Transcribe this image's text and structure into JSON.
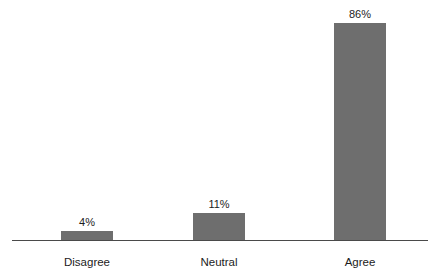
{
  "chart_data": {
    "type": "bar",
    "title": "",
    "subtitle": "",
    "xlabel": "",
    "ylabel": "",
    "categories": [
      "Disagree",
      "Neutral",
      "Agree"
    ],
    "values": [
      4,
      11,
      86
    ],
    "value_labels": [
      "4%",
      "11%",
      "86%"
    ],
    "ylim": [
      0,
      100
    ],
    "grid": false,
    "legend": false,
    "legend_position": "none",
    "axis_visible": {
      "x": true,
      "y": false
    },
    "orientation": "vertical",
    "units": "percent",
    "series": [
      {
        "name": "Response share",
        "values": [
          4,
          11,
          86
        ]
      }
    ],
    "colors": {
      "bar_fill": "#6e6e6e",
      "axis_line": "#4a4a4a",
      "text": "#1c1c1c",
      "background": "#ffffff"
    }
  }
}
